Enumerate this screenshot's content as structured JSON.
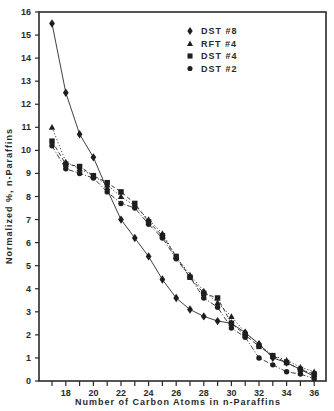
{
  "chart_data": {
    "type": "line",
    "title": "",
    "xlabel": "Number of Carbon Atoms in n-Paraffins",
    "ylabel": "Normalized %, n-Paraffins",
    "xlim": [
      16.5,
      36.5
    ],
    "ylim": [
      0,
      16
    ],
    "x_ticks": [
      17,
      18,
      19,
      20,
      21,
      22,
      23,
      24,
      25,
      26,
      27,
      28,
      29,
      30,
      31,
      32,
      33,
      34,
      35,
      36
    ],
    "x_tick_labels": [
      "18",
      "20",
      "22",
      "24",
      "26",
      "28",
      "30",
      "32",
      "34",
      "36"
    ],
    "y_ticks": [
      0,
      1,
      2,
      3,
      4,
      5,
      6,
      7,
      8,
      9,
      10,
      11,
      12,
      13,
      14,
      15,
      16
    ],
    "grid": false,
    "legend_position": "upper right",
    "x": [
      17,
      18,
      19,
      20,
      21,
      22,
      23,
      24,
      25,
      26,
      27,
      28,
      29,
      30,
      31,
      32,
      33,
      34,
      35,
      36
    ],
    "series": [
      {
        "name": "DST #8",
        "marker": "diamond",
        "line": "solid",
        "values": [
          15.5,
          12.5,
          10.7,
          9.7,
          8.3,
          7.0,
          6.2,
          5.4,
          4.4,
          3.6,
          3.1,
          2.8,
          2.6,
          2.5,
          2.1,
          1.6,
          1.0,
          0.8,
          0.5,
          0.2
        ]
      },
      {
        "name": "RFT #4",
        "marker": "triangle",
        "line": "dotted",
        "values": [
          11.0,
          9.5,
          9.2,
          8.9,
          8.5,
          8.0,
          7.6,
          7.0,
          6.4,
          5.4,
          4.6,
          3.9,
          3.4,
          2.8,
          2.1,
          1.6,
          1.1,
          0.9,
          0.6,
          0.4
        ]
      },
      {
        "name": "DST #4",
        "marker": "square",
        "line": "dashed",
        "values": [
          10.4,
          9.4,
          9.3,
          8.9,
          8.6,
          8.2,
          7.7,
          6.9,
          6.3,
          5.4,
          4.5,
          3.8,
          3.6,
          2.5,
          2.0,
          1.5,
          1.1,
          0.8,
          0.5,
          0.3
        ]
      },
      {
        "name": "DST #2",
        "marker": "circle",
        "line": "dash-dot",
        "values": [
          10.2,
          9.2,
          9.0,
          8.8,
          8.2,
          7.7,
          7.5,
          6.8,
          6.2,
          5.3,
          4.5,
          3.6,
          3.2,
          2.3,
          1.9,
          1.0,
          0.7,
          0.4,
          0.3,
          0.1
        ]
      }
    ]
  },
  "legend": {
    "items": [
      {
        "label": "DST #8",
        "marker": "diamond"
      },
      {
        "label": "RFT #4",
        "marker": "triangle"
      },
      {
        "label": "DST #4",
        "marker": "square"
      },
      {
        "label": "DST #2",
        "marker": "circle"
      }
    ]
  },
  "axes": {
    "xlabel": "Number of Carbon Atoms in n-Paraffins",
    "ylabel": "Normalized %, n-Paraffins"
  }
}
